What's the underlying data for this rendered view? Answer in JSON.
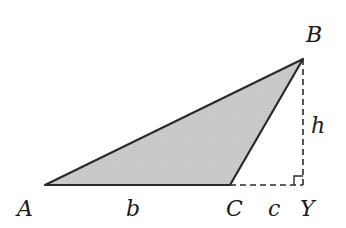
{
  "diagram": {
    "type": "triangle-with-altitude",
    "fill_color": "#c8c8c8",
    "stroke_color": "#2a2a2a",
    "vertices": {
      "A": {
        "label": "A",
        "x": 45,
        "y": 185
      },
      "B": {
        "label": "B",
        "x": 303,
        "y": 59
      },
      "C": {
        "label": "C",
        "x": 230,
        "y": 185
      },
      "Y": {
        "label": "Y",
        "x": 303,
        "y": 185
      }
    },
    "segment_labels": {
      "b": "b",
      "c": "c",
      "h": "h"
    },
    "right_angle_at": "Y"
  }
}
